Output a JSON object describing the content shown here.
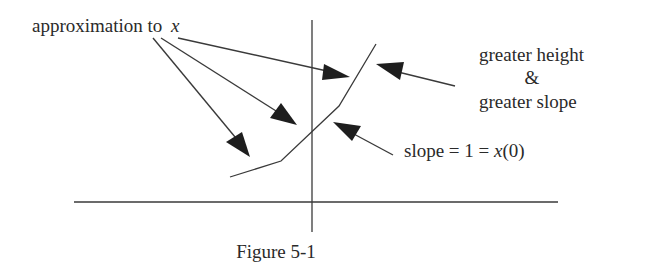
{
  "figure": {
    "caption": "Figure 5-1",
    "labels": {
      "approximation_prefix": "approximation to",
      "approximation_var": "x",
      "greater_height": "greater height",
      "ampersand": "&",
      "greater_slope": "greater slope",
      "slope_prefix": "slope = 1 = ",
      "slope_var": "x",
      "slope_suffix": "(0)"
    }
  },
  "geometry": {
    "y_axis": {
      "x": 312,
      "y1": 20,
      "y2": 232
    },
    "x_axis": {
      "y": 202,
      "x1": 74,
      "x2": 558
    },
    "curve_points": [
      [
        230,
        177
      ],
      [
        281,
        161
      ],
      [
        339,
        106
      ],
      [
        376,
        44
      ]
    ],
    "colors": {
      "ink": "#2a2a2a",
      "background": "#ffffff"
    }
  }
}
